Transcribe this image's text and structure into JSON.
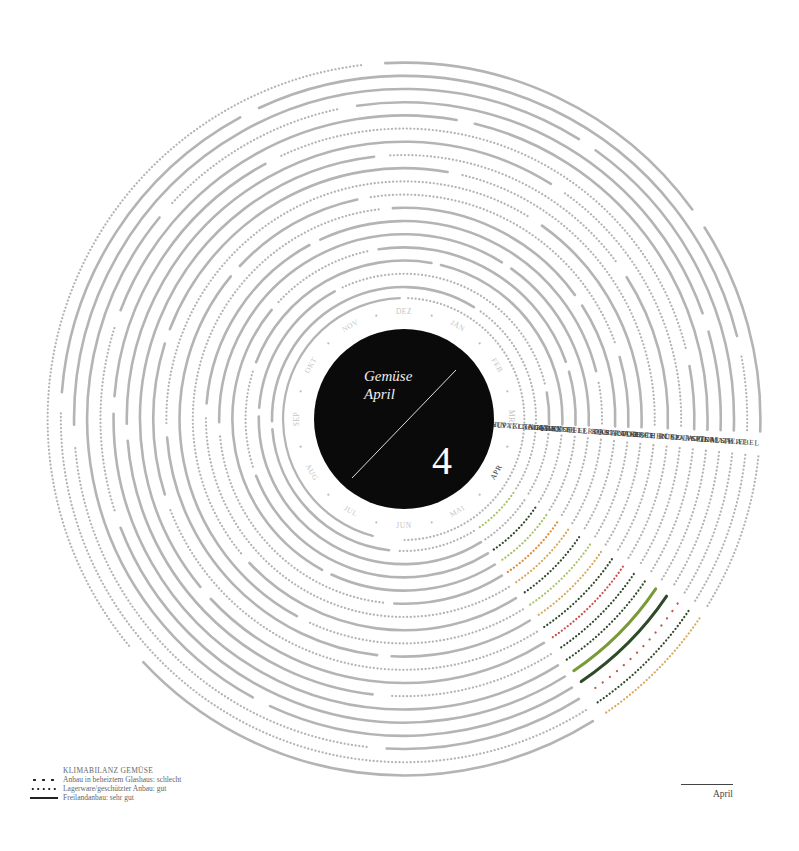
{
  "center": {
    "title_line1": "Gemüse",
    "title_line2": "April",
    "month_number": "4"
  },
  "month_ring": {
    "labels": [
      "JÄN",
      "FEB",
      "MRZ",
      "APR",
      "MAI",
      "JUN",
      "JUL",
      "AUG",
      "SEP",
      "OKT",
      "NOV",
      "DEZ"
    ],
    "active": "APR"
  },
  "legend": {
    "title": "KLIMABILANZ GEMÜSE",
    "items": [
      {
        "symbol": "sparse-dots",
        "label": "Anbau in beheiztem Glashaus: schlecht"
      },
      {
        "symbol": "dense-dots",
        "label": "Lagerware/geschützter Anbau: gut"
      },
      {
        "symbol": "solid-line",
        "label": "Freilandanbau: sehr gut"
      }
    ]
  },
  "footer": {
    "month_label": "April"
  },
  "colors": {
    "grey": "#b4b4b4",
    "dark_green": "#2f4a2a",
    "olive": "#7a9a3a",
    "light_green": "#a9c26a",
    "orange": "#e08a3a",
    "red": "#c8504a",
    "tan": "#d7a85a",
    "black": "#0a0a0a"
  },
  "chart_data": {
    "type": "radial-calendar",
    "title": "Gemüse April",
    "subtitle": "4",
    "months": [
      "JÄN",
      "FEB",
      "MRZ",
      "APR",
      "MAI",
      "JUN",
      "JUL",
      "AUG",
      "SEP",
      "OKT",
      "NOV",
      "DEZ"
    ],
    "highlight_month": "APR",
    "legend": [
      "Anbau in beheiztem Glashaus: schlecht",
      "Lagerware/geschützter Anbau: gut",
      "Freilandanbau: sehr gut"
    ],
    "series": [
      {
        "name": "CHINAKOHL",
        "april": "dense-dots",
        "color": "light_green"
      },
      {
        "name": "HÄUPTELSALAT",
        "april": "dense-dots",
        "color": "grey"
      },
      {
        "name": "GURKE",
        "april": "dense-dots",
        "color": "dark_green"
      },
      {
        "name": "KAROTTE",
        "april": "dense-dots",
        "color": "light_green"
      },
      {
        "name": "KARTOFFEL",
        "april": "dense-dots",
        "color": "orange"
      },
      {
        "name": "KNOLLENSELLERIE",
        "april": "dense-dots",
        "color": "tan"
      },
      {
        "name": "KOHL",
        "april": "dense-dots",
        "color": "dark_green"
      },
      {
        "name": "KRAUT",
        "april": "dense-dots",
        "color": "light_green"
      },
      {
        "name": "PASTINAKE",
        "april": "dense-dots",
        "color": "tan"
      },
      {
        "name": "PORREE",
        "april": "dense-dots",
        "color": "dark_green"
      },
      {
        "name": "RADIESCHEN",
        "april": "dense-dots",
        "color": "red"
      },
      {
        "name": "ROTE RÜBE",
        "april": "dense-dots",
        "color": "dark_green"
      },
      {
        "name": "RUCOLA",
        "april": "dense-dots",
        "color": "dark_green"
      },
      {
        "name": "SPARGEL",
        "april": "solid-line",
        "color": "olive"
      },
      {
        "name": "SPINAT",
        "april": "solid-line",
        "color": "dark_green"
      },
      {
        "name": "TOMATE",
        "april": "sparse-dots",
        "color": "red"
      },
      {
        "name": "VOGERLSALAT",
        "april": "dense-dots",
        "color": "dark_green"
      },
      {
        "name": "ZWIEBEL",
        "april": "dense-dots",
        "color": "tan"
      }
    ]
  }
}
